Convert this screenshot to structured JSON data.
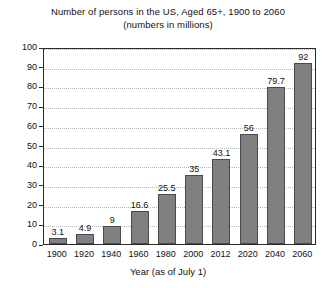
{
  "chart_data": {
    "type": "bar",
    "title": "Number of persons in the US, Aged 65+, 1900 to 2060",
    "subtitle": "(numbers in millions)",
    "xlabel": "Year (as of July 1)",
    "ylabel": "",
    "categories": [
      "1900",
      "1920",
      "1940",
      "1960",
      "1980",
      "2000",
      "2012",
      "2020",
      "2040",
      "2060"
    ],
    "values": [
      3.1,
      4.9,
      9,
      16.6,
      25.5,
      35,
      43.1,
      56,
      79.7,
      92
    ],
    "value_labels": [
      "3.1",
      "4.9",
      "9",
      "16.6",
      "25.5",
      "35",
      "43.1",
      "56",
      "79.7",
      "92"
    ],
    "ylim": [
      0,
      100
    ],
    "yticks": [
      0,
      10,
      20,
      30,
      40,
      50,
      60,
      70,
      80,
      90,
      100
    ],
    "ytick_labels": [
      "0",
      "10",
      "20",
      "30",
      "40",
      "50",
      "60",
      "70",
      "80",
      "90",
      "100"
    ],
    "grid": true,
    "grid_axis": "y",
    "legend": false,
    "bar_color": "#808080",
    "bar_edge_color": "#4a4a4a",
    "grid_color": "#b6b6b6",
    "axis_color": "#2b2b2b",
    "background_color": "#ffffff"
  }
}
